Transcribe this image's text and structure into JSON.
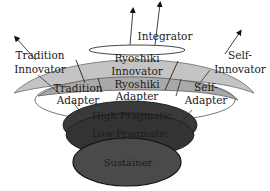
{
  "diagram": {
    "type": "layered-disc-model",
    "colors": {
      "innovator_disc": "#c4c4c4",
      "adapter_disc": "#a9a9a9",
      "high_pragmatic_disc": "#3a3a3a",
      "low_pragmatic_disc": "#333333",
      "sustainer_disc": "#4a4a4a",
      "outline": "#555555",
      "dark_text": "#1c1c1c"
    },
    "labels": {
      "integrator": "Integrator",
      "tradition_innovator_1": "Tradition",
      "tradition_innovator_2": "Innovator",
      "ryoshiki_innovator_1": "Ryoshiki",
      "ryoshiki_innovator_2": "Innovator",
      "self_innovator_1": "Self-",
      "self_innovator_2": "Innovator",
      "tradition_adapter_1": "Tradition",
      "tradition_adapter_2": "Adapter",
      "ryoshiki_adapter_1": "Ryoshiki",
      "ryoshiki_adapter_2": "Adapter",
      "self_adapter_1": "Self-",
      "self_adapter_2": "Adapter",
      "high_pragmatic": "High Pragmatic",
      "low_pragmatic": "Low Pragmatic",
      "sustainer": "Sustainer"
    },
    "layers": [
      {
        "name": "Integrator",
        "level": 1
      },
      {
        "name": "Innovator",
        "level": 2,
        "segments": [
          "Tradition Innovator",
          "Ryoshiki Innovator",
          "Self-Innovator"
        ]
      },
      {
        "name": "Adapter",
        "level": 3,
        "segments": [
          "Tradition Adapter",
          "Ryoshiki Adapter",
          "Self-Adapter"
        ]
      },
      {
        "name": "High Pragmatic",
        "level": 4
      },
      {
        "name": "Low Pragmatic",
        "level": 5
      },
      {
        "name": "Sustainer",
        "level": 6
      }
    ]
  }
}
